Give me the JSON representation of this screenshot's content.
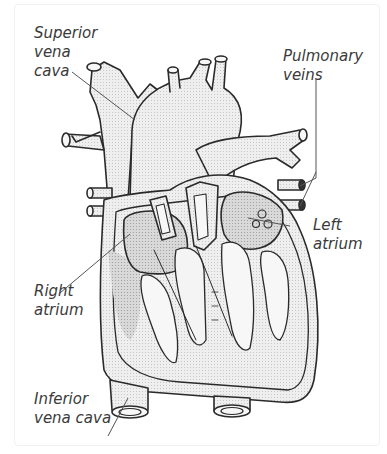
{
  "diagram": {
    "labels": {
      "superior_vena_cava": [
        "Superior",
        "vena",
        "cava"
      ],
      "pulmonary_veins": [
        "Pulmonary",
        "veins"
      ],
      "left_atrium": [
        "Left",
        "atrium"
      ],
      "right_atrium": [
        "Right",
        "atrium"
      ],
      "inferior_vena_cava": [
        "Inferior",
        "vena cava"
      ]
    },
    "colors": {
      "outline": "#2a2a2a",
      "vessel_fill": "#ececec",
      "atrium_fill": "#d6d6d6",
      "wall_fill": "#e4e4e4",
      "chamber_fill": "#f6f6f6",
      "label_text": "#3a3a3a"
    }
  }
}
